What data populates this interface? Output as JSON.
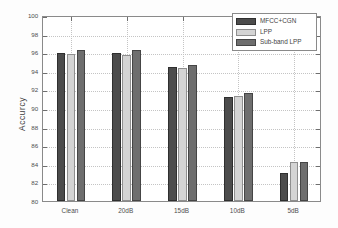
{
  "chart_data": {
    "type": "bar",
    "title": "",
    "xlabel": "",
    "ylabel": "Accurcy",
    "categories": [
      "Clean",
      "20dB",
      "15dB",
      "10dB",
      "5dB"
    ],
    "series": [
      {
        "name": "MFCC+CGN",
        "color": "#4c4c4c",
        "values": [
          95.95,
          95.95,
          94.45,
          91.15,
          83.0
        ]
      },
      {
        "name": "LPP",
        "color": "#d4d4d4",
        "values": [
          95.8,
          95.65,
          94.25,
          91.3,
          84.15
        ]
      },
      {
        "name": "Sub-band LPP",
        "color": "#6e6e6e",
        "values": [
          96.2,
          96.2,
          94.65,
          91.6,
          84.2
        ]
      }
    ],
    "ylim": [
      80,
      100
    ],
    "ytick_step": 2,
    "yticks": [
      80,
      82,
      84,
      86,
      88,
      90,
      92,
      94,
      96,
      98,
      100
    ],
    "ytick_labels": [
      "80",
      "82",
      "84",
      "86",
      "88",
      "90",
      "92",
      "94",
      "96",
      "98",
      "100"
    ],
    "grid": true,
    "grid_axis": "both",
    "legend_position": "upper right",
    "annotations": []
  },
  "legend": {
    "entries": [
      {
        "label": "MFCC+CGN"
      },
      {
        "label": "LPP"
      },
      {
        "label": "Sub-band LPP"
      }
    ]
  }
}
